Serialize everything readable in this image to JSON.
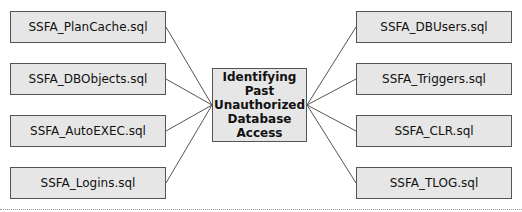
{
  "center": {
    "label": "Identifying Past Unauthorized Database Access"
  },
  "left_boxes": [
    {
      "label": "SSFA_PlanCache.sql"
    },
    {
      "label": "SSFA_DBObjects.sql"
    },
    {
      "label": "SSFA_AutoEXEC.sql"
    },
    {
      "label": "SSFA_Logins.sql"
    }
  ],
  "right_boxes": [
    {
      "label": "SSFA_DBUsers.sql"
    },
    {
      "label": "SSFA_Triggers.sql"
    },
    {
      "label": "SSFA_CLR.sql"
    },
    {
      "label": "SSFA_TLOG.sql"
    }
  ]
}
